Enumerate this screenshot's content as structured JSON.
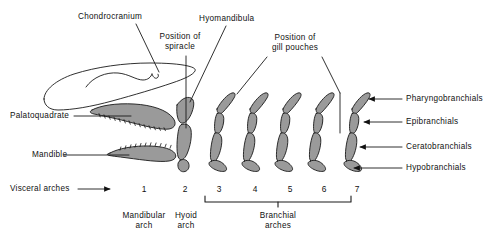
{
  "figure": {
    "colors": {
      "cartilage_fill": "#9a9a9a",
      "outline": "#1a1a1a",
      "background": "#ffffff",
      "text": "#111111"
    }
  },
  "labels": {
    "chondrocranium": "Chondrocranium",
    "position_of_spiracle_line1": "Position of",
    "position_of_spiracle_line2": "spiracle",
    "hyomandibula": "Hyomandibula",
    "position_of_gill_pouches_line1": "Position of",
    "position_of_gill_pouches_line2": "gill pouches",
    "palatoquadrate": "Palatoquadrate",
    "mandible": "Mandible",
    "visceral_arches": "Visceral arches",
    "pharyngobranchials": "Pharyngobranchials",
    "epibranchials": "Epibranchials",
    "ceratobranchials": "Ceratobranchials",
    "hypobranchials": "Hypobranchials"
  },
  "arches": {
    "numbers": [
      "1",
      "2",
      "3",
      "4",
      "5",
      "6",
      "7"
    ],
    "groups": [
      {
        "name": "mandibular",
        "line1": "Mandibular",
        "line2": "arch",
        "members": [
          "1"
        ]
      },
      {
        "name": "hyoid",
        "line1": "Hyoid",
        "line2": "arch",
        "members": [
          "2"
        ]
      },
      {
        "name": "branchial",
        "line1": "Branchial",
        "line2": "arches",
        "members": [
          "3",
          "4",
          "5",
          "6",
          "7"
        ]
      }
    ]
  },
  "icons": {
    "arrow_right": "arrow-right-icon",
    "arrow_left": "arrow-left-icon",
    "leader_line": "leader-line-icon",
    "bracket": "bracket-icon"
  }
}
